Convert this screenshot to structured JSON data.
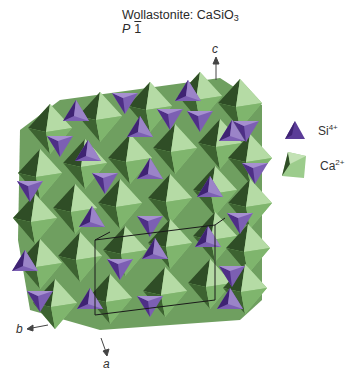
{
  "title": {
    "mineral": "Wollastonite",
    "formula_prefix": "CaSiO",
    "formula_sub": "3",
    "space_group_letter": "P",
    "space_group_rest": "1"
  },
  "axes": {
    "a": "a",
    "b": "b",
    "c": "c"
  },
  "legend": [
    {
      "ion": "Si",
      "charge": "4+",
      "shape": "tetrahedron",
      "color": "#4e2f86"
    },
    {
      "ion": "Ca",
      "charge": "2+",
      "shape": "octahedron",
      "color": "#9ccc8c"
    }
  ],
  "colors": {
    "tetra_dark": "#3f2373",
    "tetra_mid": "#7c5fb3",
    "tetra_light": "#a690d0",
    "octa_dark": "#2f4d26",
    "octa_mid": "#8fc27d",
    "octa_light": "#c3e2b5",
    "unit_cell": "#1a1a1a"
  }
}
